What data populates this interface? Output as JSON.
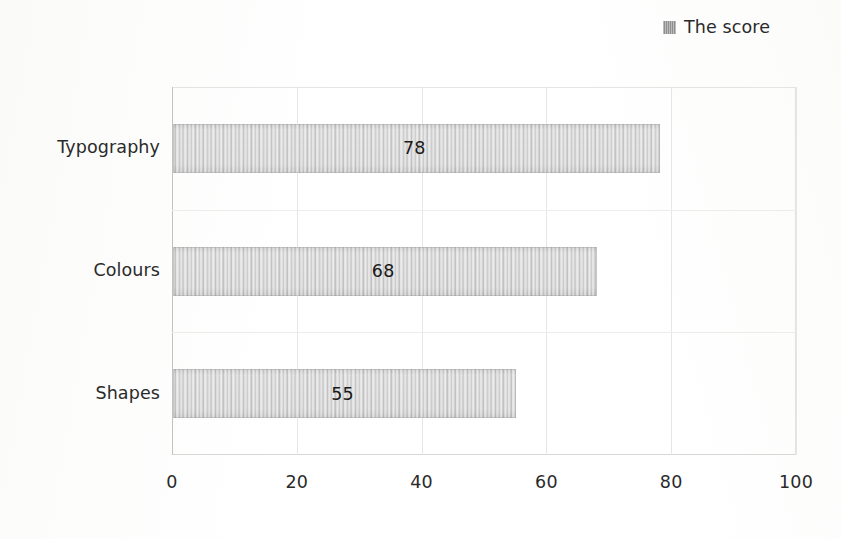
{
  "legend": {
    "marker_name": "legend-swatch-icon",
    "label": "The score",
    "color": "#9a9a9a",
    "position": "top-right"
  },
  "chart_data": {
    "type": "bar",
    "orientation": "horizontal",
    "title": "",
    "subtitle": "",
    "xlabel": "",
    "ylabel": "",
    "categories": [
      "Typography",
      "Colours",
      "Shapes"
    ],
    "values": [
      78,
      68,
      55
    ],
    "series": [
      {
        "name": "The score",
        "values": [
          78,
          68,
          55
        ],
        "color": "#d2d2d2"
      }
    ],
    "data_labels": [
      "78",
      "68",
      "55"
    ],
    "xlim": [
      0,
      100
    ],
    "xticks": [
      0,
      20,
      40,
      60,
      80,
      100
    ],
    "xtick_labels": [
      "0",
      "20",
      "40",
      "60",
      "80",
      "100"
    ],
    "grid": {
      "vertical": true,
      "horizontal": true,
      "color": "#e6e6e4"
    },
    "legend_position": "top-right"
  },
  "axis": {
    "x_tick_labels": [
      "0",
      "20",
      "40",
      "60",
      "80",
      "100"
    ],
    "y_category_labels": [
      "Typography",
      "Colours",
      "Shapes"
    ]
  },
  "bars": [
    {
      "category": "Typography",
      "value": 78,
      "label": "78"
    },
    {
      "category": "Colours",
      "value": 68,
      "label": "68"
    },
    {
      "category": "Shapes",
      "value": 55,
      "label": "55"
    }
  ]
}
